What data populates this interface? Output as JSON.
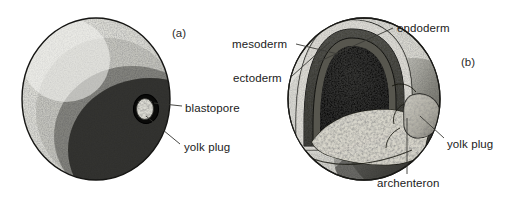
{
  "figure": {
    "type": "biological-illustration",
    "background_color": "#ffffff",
    "text_color": "#1b1b1b",
    "panels": [
      {
        "id": "a",
        "letter": "(a)",
        "description": "External view of gastrula showing blastopore with yolk plug",
        "labels": [
          "blastopore",
          "yolk plug"
        ]
      },
      {
        "id": "b",
        "letter": "(b)",
        "description": "Cut-away view of gastrula showing germ layers, archenteron and yolk plug",
        "labels": [
          "mesoderm",
          "ectoderm",
          "endoderm",
          "archenteron",
          "yolk plug"
        ]
      }
    ]
  },
  "labels": {
    "panel_a_letter": "(a)",
    "panel_b_letter": "(b)",
    "blastopore": "blastopore",
    "yolk_plug_a": "yolk plug",
    "mesoderm": "mesoderm",
    "ectoderm": "ectoderm",
    "endoderm": "endoderm",
    "yolk_plug_b": "yolk plug",
    "archenteron": "archenteron"
  }
}
